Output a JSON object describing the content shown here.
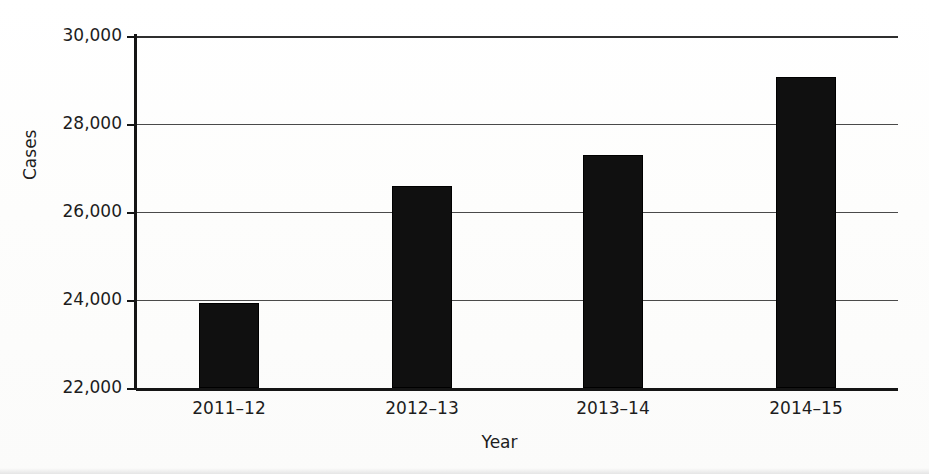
{
  "chart_data": {
    "type": "bar",
    "title": "",
    "subtitle": "",
    "xlabel": "Year",
    "ylabel": "Cases",
    "categories": [
      "2011–12",
      "2012–13",
      "2013–14",
      "2014–15"
    ],
    "values": [
      23930,
      26590,
      27300,
      29060
    ],
    "series": [
      {
        "name": "Cases",
        "values": [
          23930,
          26590,
          27300,
          29060
        ]
      }
    ],
    "ylim": [
      22000,
      30000
    ],
    "y_ticks": [
      22000,
      24000,
      26000,
      28000,
      30000
    ],
    "y_tick_labels": [
      "22,000",
      "24,000",
      "26,000",
      "28,000",
      "30,000"
    ],
    "grid": "horizontal",
    "legend": "none",
    "bar_color": "#101010",
    "axis_color": "#151515",
    "grid_color": "#4a4a4a",
    "background": "#ffffff",
    "annotations": []
  },
  "axes": {
    "y_title": "Cases",
    "x_title": "Year"
  }
}
